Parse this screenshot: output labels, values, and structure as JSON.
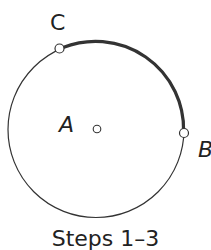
{
  "diagram": {
    "type": "geometric-construction",
    "circle": {
      "center": "A",
      "stroke": "#333333"
    },
    "arc": {
      "from": "B",
      "to": "C",
      "stroke": "#333333",
      "emphasis": "thick"
    },
    "points": [
      {
        "id": "A",
        "label": "A",
        "role": "center"
      },
      {
        "id": "B",
        "label": "B",
        "role": "point-on-circle"
      },
      {
        "id": "C",
        "label": "C",
        "role": "point-on-circle"
      }
    ]
  },
  "caption": "Steps 1–3"
}
